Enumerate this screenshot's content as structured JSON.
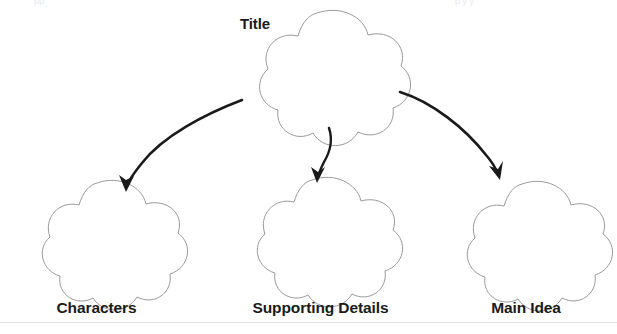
{
  "page": {
    "kind": "graphic-organizer-worksheet",
    "background_color": "#ffffff",
    "outline_color": "#9a9a9e",
    "arrow_color": "#1a1a1a",
    "text_color": "#1a1a1a",
    "width": 617,
    "height": 334
  },
  "organizer": {
    "top_node": {
      "label": "Title",
      "shape": "five-lobe-flower",
      "label_position": "upper-left"
    },
    "bottom_nodes": [
      {
        "label": "Characters",
        "shape": "five-lobe-flower",
        "label_position": "below"
      },
      {
        "label": "Supporting Details",
        "shape": "five-lobe-flower",
        "label_position": "below"
      },
      {
        "label": "Main Idea",
        "shape": "five-lobe-flower",
        "label_position": "below"
      }
    ],
    "connectors": [
      {
        "from": "Title",
        "to": "Characters",
        "style": "curved-arrow",
        "direction": "down-left"
      },
      {
        "from": "Title",
        "to": "Supporting Details",
        "style": "curved-arrow",
        "direction": "down"
      },
      {
        "from": "Title",
        "to": "Main Idea",
        "style": "curved-arrow",
        "direction": "down-right"
      }
    ]
  },
  "artifacts": {
    "clipped_top_left": "pp",
    "clipped_top_right": "p         y   y",
    "footer_rule_color": "#e4e4e8"
  }
}
